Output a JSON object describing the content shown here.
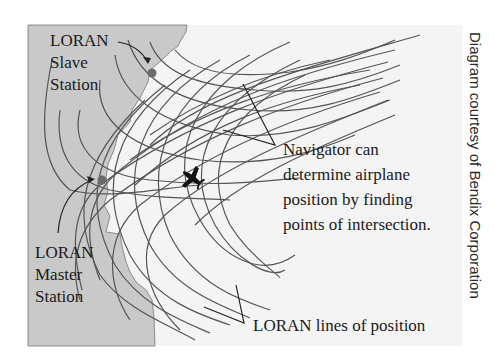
{
  "diagram": {
    "labels": {
      "slave_station": [
        "LORAN",
        "Slave",
        "Station"
      ],
      "master_station": [
        "LORAN",
        "Master",
        "Station"
      ],
      "navigator_note": [
        "Navigator can",
        "determine airplane",
        "position by finding",
        "points of intersection."
      ],
      "lines_of_position": "LORAN lines of position"
    },
    "credit": "Diagram courtesy of Bendix Corporation",
    "icons": [
      "slave-station-dot",
      "master-station-dot",
      "airplane-icon"
    ],
    "colors": {
      "land": "#c9c9c9",
      "sea": "#f4f4f4",
      "lines": "#555555",
      "station_dot": "#6b6b6b",
      "text": "#1a1a1a"
    }
  }
}
